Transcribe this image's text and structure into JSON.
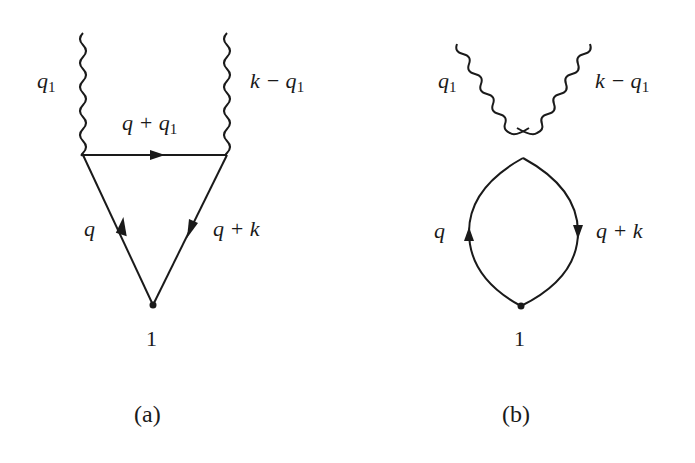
{
  "figure": {
    "panels": [
      {
        "id": "a",
        "caption": "(a)",
        "type": "triangle-diagram",
        "labels": {
          "left_photon": {
            "main": "q",
            "sub": "1"
          },
          "right_photon": {
            "main": "k − q",
            "sub": "1"
          },
          "top_propagator": {
            "main": "q + q",
            "sub": "1"
          },
          "left_propagator": {
            "main": "q"
          },
          "right_propagator": {
            "main": "q + k"
          },
          "vertex": "1"
        }
      },
      {
        "id": "b",
        "caption": "(b)",
        "type": "seagull-bubble-diagram",
        "labels": {
          "left_photon": {
            "main": "q",
            "sub": "1"
          },
          "right_photon": {
            "main": "k − q",
            "sub": "1"
          },
          "left_propagator": {
            "main": "q"
          },
          "right_propagator": {
            "main": "q + k"
          },
          "vertex": "1"
        }
      }
    ],
    "colors": {
      "line": "#1a1a1a",
      "background": "#ffffff"
    }
  }
}
